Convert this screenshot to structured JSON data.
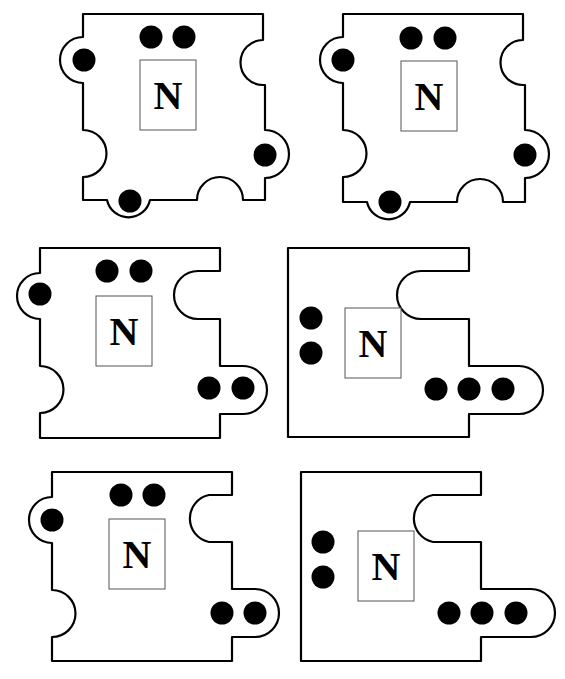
{
  "colors": {
    "outline": "#000000",
    "dot": "#000000",
    "box": "#555555",
    "background": "#ffffff"
  },
  "pieces": [
    {
      "id": "piece-1",
      "label": "N",
      "path": "M83,14 L263,14 L263,40 A22,22 0 0 0 263,85 L265,85 L265,130 A24,24 0 0 1 265,178 L265,200 L243,200 A23,23 0 0 0 197,200 L150,200 A22,22 0 0 1 107,200 L83,200 L83,177 A23,23 0 0 0 83,130 L83,83 A23,23 0 0 1 83,37 Z",
      "box": {
        "x": 140,
        "y": 60,
        "w": 56,
        "h": 70
      },
      "dots": [
        [
          151,
          37
        ],
        [
          184,
          37
        ],
        [
          84,
          60
        ],
        [
          265,
          155
        ],
        [
          130,
          201
        ]
      ]
    },
    {
      "id": "piece-2",
      "label": "N",
      "path": "M343,14 L523,14 L523,40 A22,22 0 0 0 523,85 L525,85 L525,130 A24,24 0 0 1 525,178 L525,202 L503,202 A23,23 0 0 0 457,202 L410,202 A22,22 0 0 1 367,202 L343,202 L343,177 A23,23 0 0 0 343,130 L343,83 A23,23 0 0 1 343,37 Z",
      "box": {
        "x": 401,
        "y": 61,
        "w": 56,
        "h": 70
      },
      "dots": [
        [
          411,
          38
        ],
        [
          445,
          38
        ],
        [
          343,
          60
        ],
        [
          525,
          155
        ],
        [
          390,
          202
        ]
      ]
    },
    {
      "id": "piece-3",
      "label": "N",
      "path": "M40,248 L220,248 L220,271 L198,271 A24,24 0 0 0 198,319 L220,319 L220,366 L243,366 A24,24 0 0 1 243,414 L220,414 L220,438 L40,438 L40,413 A23,23 0 0 0 40,366 L40,319 A23,23 0 0 1 40,273 Z",
      "box": {
        "x": 96,
        "y": 296,
        "w": 56,
        "h": 70
      },
      "dots": [
        [
          40,
          294
        ],
        [
          107,
          271
        ],
        [
          141,
          271
        ],
        [
          209,
          388
        ],
        [
          243,
          388
        ]
      ]
    },
    {
      "id": "piece-4",
      "label": "N",
      "path": "M288,248 L469,248 L469,271 L421,271 A24,24 0 0 0 421,319 L469,319 L469,366 L519,366 A24,24 0 0 1 519,414 L469,414 L469,437 L288,437 Z",
      "box": {
        "x": 345,
        "y": 308,
        "w": 56,
        "h": 70
      },
      "dots": [
        [
          311,
          318
        ],
        [
          311,
          353
        ],
        [
          436,
          389
        ],
        [
          469,
          389
        ],
        [
          503,
          389
        ]
      ]
    },
    {
      "id": "piece-5",
      "label": "N",
      "path": "M52,472 L232,472 L232,495 L209,495 A24,24 0 0 0 209,542 L232,542 L232,589 L255,589 A24,24 0 0 1 255,637 L232,637 L232,661 L52,661 L52,637 A23,23 0 0 0 52,590 L52,543 A23,23 0 0 1 52,497 Z",
      "box": {
        "x": 109,
        "y": 519,
        "w": 56,
        "h": 70
      },
      "dots": [
        [
          52,
          520
        ],
        [
          121,
          495
        ],
        [
          154,
          495
        ],
        [
          222,
          613
        ],
        [
          255,
          613
        ]
      ]
    },
    {
      "id": "piece-6",
      "label": "N",
      "path": "M301,472 L481,472 L481,495 L433,495 A24,24 0 0 0 433,542 L481,542 L481,589 L531,589 A24,24 0 0 1 531,637 L481,637 L481,661 L301,661 Z",
      "box": {
        "x": 358,
        "y": 531,
        "w": 56,
        "h": 70
      },
      "dots": [
        [
          323,
          542
        ],
        [
          323,
          577
        ],
        [
          449,
          613
        ],
        [
          482,
          613
        ],
        [
          516,
          613
        ]
      ]
    }
  ]
}
